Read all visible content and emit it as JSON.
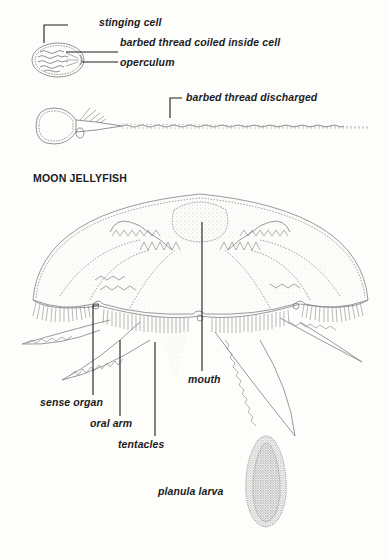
{
  "nematocyst": {
    "labels": {
      "stinging_cell": "stinging cell",
      "coiled_thread": "barbed thread coiled inside cell",
      "operculum": "operculum",
      "discharged_thread": "barbed thread discharged"
    }
  },
  "jellyfish": {
    "title": "MOON JELLYFISH",
    "labels": {
      "mouth": "mouth",
      "sense_organ": "sense organ",
      "oral_arm": "oral arm",
      "tentacles": "tentacles",
      "planula_larva": "planula larva"
    }
  },
  "colors": {
    "ink": "#1c1c1c",
    "line": "#7a7a7a",
    "paper": "#fdfdfb"
  }
}
